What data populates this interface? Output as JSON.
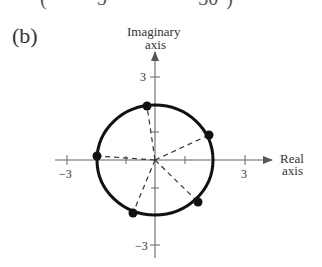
{
  "top_cut_text": "(          5          ·       30°)",
  "panel_label": "(b)",
  "axes": {
    "y_label_line1": "Imaginary",
    "y_label_line2": "axis",
    "x_label_line1": "Real",
    "x_label_line2": "axis",
    "x_ticks": [
      {
        "value": -3,
        "label": "−3"
      },
      {
        "value": 3,
        "label": "3"
      }
    ],
    "y_ticks": [
      {
        "value": 3,
        "label": "3"
      },
      {
        "value": -3,
        "label": "−3"
      }
    ]
  },
  "figure": {
    "circle_radius": 2,
    "center": [
      0,
      0
    ],
    "points_angles_deg": [
      18,
      90,
      162,
      234,
      306
    ],
    "colors": {
      "curve": "#111111",
      "axes": "#666666",
      "dash": "#333333"
    }
  }
}
